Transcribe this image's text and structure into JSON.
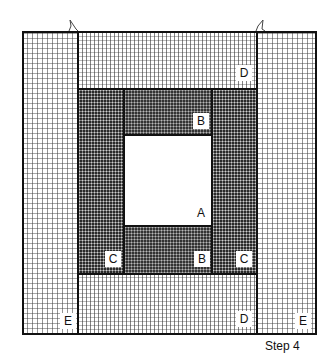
{
  "caption": "Step 4",
  "pieces": {
    "A": {
      "label": "A",
      "name": "center square",
      "pattern": "plain white"
    },
    "B_top": {
      "label": "B",
      "pattern": "dark dotted"
    },
    "B_bottom": {
      "label": "B",
      "pattern": "dark dotted"
    },
    "C_left": {
      "label": "C",
      "pattern": "dark dotted"
    },
    "C_right": {
      "label": "C",
      "pattern": "dark dotted"
    },
    "D_top": {
      "label": "D",
      "pattern": "fine grid"
    },
    "D_bottom": {
      "label": "D",
      "pattern": "fine grid"
    },
    "E_left": {
      "label": "E",
      "pattern": "coarse grid"
    },
    "E_right": {
      "label": "E",
      "pattern": "coarse grid"
    }
  },
  "markers": {
    "notch_count": 2,
    "notch_shape": "fold-arrow"
  },
  "colors": {
    "outline": "#111111",
    "dark_fabric": "#2a2a2a",
    "background": "#ffffff"
  }
}
